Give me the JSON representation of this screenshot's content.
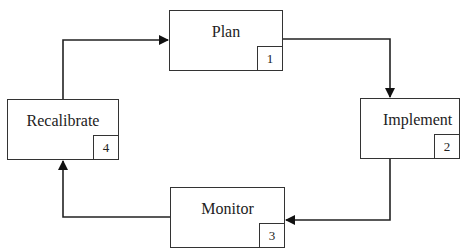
{
  "diagram": {
    "type": "cycle",
    "steps": [
      {
        "id": "plan",
        "label": "Plan",
        "number": "1"
      },
      {
        "id": "implement",
        "label": "Implement",
        "number": "2"
      },
      {
        "id": "monitor",
        "label": "Monitor",
        "number": "3"
      },
      {
        "id": "recalibrate",
        "label": "Recalibrate",
        "number": "4"
      }
    ],
    "edges": [
      {
        "from": "plan",
        "to": "implement"
      },
      {
        "from": "implement",
        "to": "monitor"
      },
      {
        "from": "monitor",
        "to": "recalibrate"
      },
      {
        "from": "recalibrate",
        "to": "plan"
      }
    ],
    "colors": {
      "line": "#222222",
      "box_border": "#333333",
      "background": "#ffffff"
    }
  }
}
